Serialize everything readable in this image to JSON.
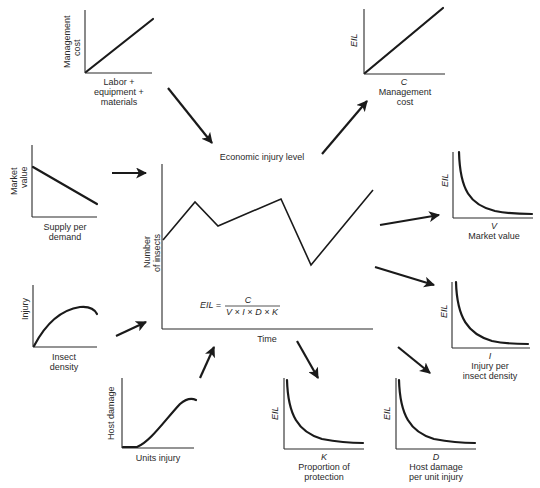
{
  "diagram": {
    "center": {
      "title": "Economic injury level",
      "ylabel_line1": "Number",
      "ylabel_line2": "of insects",
      "xlabel": "Time",
      "formula_lhs": "EIL =",
      "formula_num": "C",
      "formula_den": "V × I × D × K"
    },
    "inputs": [
      {
        "id": "management-cost",
        "ylabel_line1": "Management",
        "ylabel_line2": "cost",
        "xlabel_line1": "Labor +",
        "xlabel_line2": "equipment +",
        "xlabel_line3": "materials",
        "shape": "linear-increasing"
      },
      {
        "id": "market-value",
        "ylabel_line1": "Market",
        "ylabel_line2": "value",
        "xlabel_line1": "Supply per",
        "xlabel_line2": "demand",
        "shape": "linear-decreasing"
      },
      {
        "id": "injury",
        "ylabel": "Injury",
        "xlabel_line1": "Insect",
        "xlabel_line2": "density",
        "shape": "concave-saturating"
      },
      {
        "id": "host-damage",
        "ylabel": "Host damage",
        "xlabel": "Units injury",
        "shape": "sigmoid"
      }
    ],
    "outputs": [
      {
        "id": "eil-vs-c",
        "ylabel": "EIL",
        "xsymbol": "C",
        "xlabel_line1": "Management",
        "xlabel_line2": "cost",
        "shape": "linear-increasing"
      },
      {
        "id": "eil-vs-v",
        "ylabel": "EIL",
        "xsymbol": "V",
        "xlabel_line1": "Market value",
        "shape": "inverse"
      },
      {
        "id": "eil-vs-i",
        "ylabel": "EIL",
        "xsymbol": "I",
        "xlabel_line1": "Injury per",
        "xlabel_line2": "insect density",
        "shape": "inverse"
      },
      {
        "id": "eil-vs-d",
        "ylabel": "EIL",
        "xsymbol": "D",
        "xlabel_line1": "Host damage",
        "xlabel_line2": "per unit injury",
        "shape": "inverse"
      },
      {
        "id": "eil-vs-k",
        "ylabel": "EIL",
        "xsymbol": "K",
        "xlabel_line1": "Proportion of",
        "xlabel_line2": "protection",
        "shape": "inverse"
      }
    ],
    "colors": {
      "ink": "#1a1a1a",
      "background": "#ffffff"
    }
  }
}
